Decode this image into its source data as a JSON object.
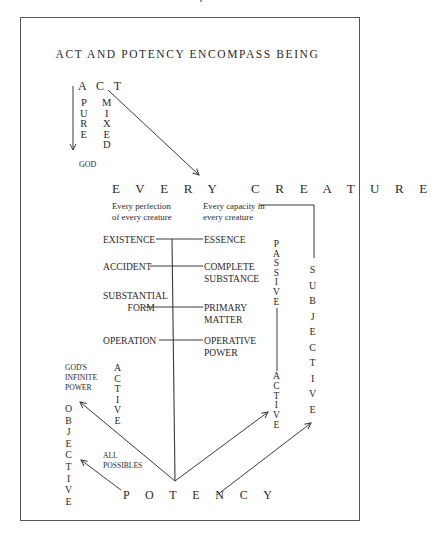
{
  "title": "ACT AND POTENCY ENCOMPASS BEING",
  "top": {
    "act": "A C T",
    "pure": [
      "P",
      "U",
      "R",
      "E"
    ],
    "mixed": [
      "M",
      "I",
      "X",
      "E",
      "D"
    ],
    "god": "GOD"
  },
  "every_creature": "E V E R Y   C R E A T U R E",
  "captions": {
    "perfection": [
      "Every perfection",
      "of every creature"
    ],
    "capacity": [
      "Every capacity in",
      "every creature"
    ]
  },
  "pairs": [
    {
      "left": [
        "EXISTENCE"
      ],
      "right": [
        "ESSENCE"
      ]
    },
    {
      "left": [
        "ACCIDENT"
      ],
      "right": [
        "COMPLETE",
        "SUBSTANCE"
      ]
    },
    {
      "left": [
        "SUBSTANTIAL",
        "FORM"
      ],
      "right": [
        "PRIMARY",
        "MATTER"
      ]
    },
    {
      "left": [
        "OPERATION"
      ],
      "right": [
        "OPERATIVE",
        "POWER"
      ]
    }
  ],
  "right_columns": {
    "passive": [
      "P",
      "A",
      "S",
      "S",
      "I",
      "V",
      "E"
    ],
    "active": [
      "A",
      "C",
      "T",
      "I",
      "V",
      "E"
    ],
    "subjective": [
      "S",
      "U",
      "B",
      "J",
      "E",
      "C",
      "T",
      "I",
      "V",
      "E"
    ]
  },
  "left_columns": {
    "gods_infinite_power": [
      "GOD'S",
      "INFINITE",
      "POWER"
    ],
    "active": [
      "A",
      "C",
      "T",
      "I",
      "V",
      "E"
    ],
    "objective": [
      "O",
      "B",
      "J",
      "E",
      "C",
      "T",
      "I",
      "V",
      "E"
    ],
    "all_possibles": [
      "ALL",
      "POSSIBLES"
    ]
  },
  "potency": "P O T E N C Y",
  "colors": {
    "ink": "#2a2a2a",
    "line": "#3a3a3a",
    "frame": "#555555",
    "background": "#ffffff"
  }
}
